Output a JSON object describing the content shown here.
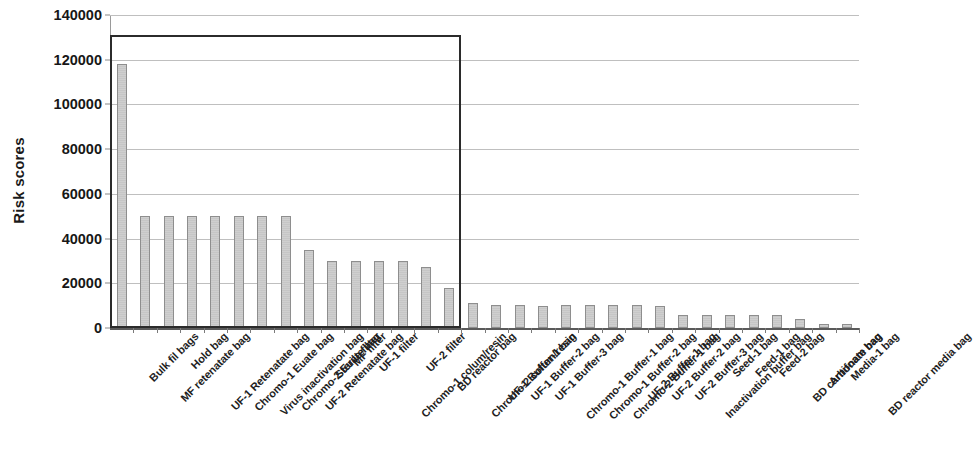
{
  "chart_data": {
    "type": "bar",
    "title": "",
    "subtitle": "",
    "xlabel": "",
    "ylabel": "Risk scores",
    "ylim": [
      0,
      140000
    ],
    "ytick_values": [
      0,
      20000,
      40000,
      60000,
      80000,
      100000,
      120000,
      140000
    ],
    "ytick_labels": [
      "0",
      "20000",
      "40000",
      "60000",
      "80000",
      "100000",
      "120000",
      "140000"
    ],
    "grid": true,
    "legend": null,
    "legend_position": "none",
    "bar_color": "#cdcdcd",
    "bar_edge_color": "#8e8e8e",
    "annotations": [
      {
        "name": "highlight-rectangle",
        "type": "rectangle",
        "description": "black rectangle outlining the 16 highest-risk items",
        "x_from_category": "Bulk fil bags",
        "x_to_category": "Chromo-2 colum/resin",
        "y_from": 0,
        "y_to": 131000,
        "color": "#2b2b2b"
      }
    ],
    "categories": [
      "Bulk fil bags",
      "MF retenatate bag",
      "Hold bag",
      "UF-1 Retenatate bag",
      "Chromo-1 Euate bag",
      "Virus inactivation bag",
      "Chromo-2 Euate bag",
      "UF-2 Retenatate bag",
      "Sterile filter",
      "MF filter",
      "UF-1 filter",
      "Chromo-1 colum/resin",
      "UF-2 filter",
      "BD reactor bag",
      "Chromo-2 colum/resin",
      "UF-1 Buffer-1 bag",
      "UF-1 Buffer-2 bag",
      "UF-1 Buffer-3 bag",
      "Chromo-1 Buffer-1 bag",
      "Chromo-1 Buffer-2 bag",
      "Chromo-2 Buffer-1 bag",
      "UF-2 Buffer-1 bag",
      "UF-2 Buffer-2 bag",
      "UF-2 Buffer-3 bag",
      "Inactivation buffer bag",
      "Seed-1 bag",
      "Feed-1 bag",
      "Feed-2 bag",
      "BD carbonate bag",
      "Antifoam bag",
      "Media-1 bag",
      "BD reactor media bag"
    ],
    "values": [
      118000,
      50000,
      50000,
      50000,
      50000,
      50000,
      50000,
      50000,
      35000,
      30000,
      30000,
      30000,
      30000,
      27500,
      18000,
      11000,
      10500,
      10500,
      10000,
      10500,
      10500,
      10500,
      10500,
      10000,
      6000,
      6000,
      6000,
      6000,
      6000,
      4000,
      1800,
      1800
    ]
  }
}
